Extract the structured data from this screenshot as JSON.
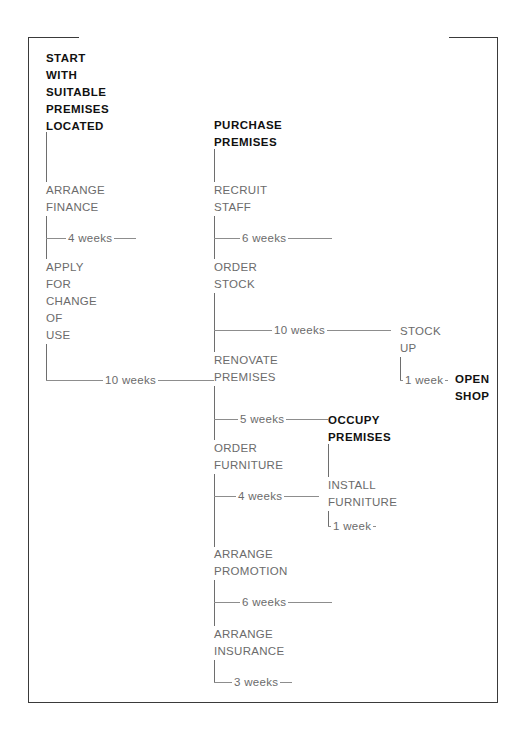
{
  "diagram": {
    "type": "critical-path-network",
    "frame_color": "#3a3a3a",
    "connector_color": "#8d8d8d",
    "milestone_color": "#111111",
    "task_color": "#6b6b6b"
  },
  "milestones": [
    {
      "id": "start",
      "label": "START\nWITH\nSUITABLE\nPREMISES\nLOCATED"
    },
    {
      "id": "purchase",
      "label": "PURCHASE\nPREMISES"
    },
    {
      "id": "occupy",
      "label": "OCCUPY\nPREMISES"
    },
    {
      "id": "open",
      "label": "OPEN\nSHOP"
    }
  ],
  "tasks": [
    {
      "id": "arrange-finance",
      "label": "ARRANGE\nFINANCE",
      "duration": "4 weeks"
    },
    {
      "id": "apply-change-use",
      "label": "APPLY\nFOR\nCHANGE\nOF\nUSE",
      "duration": "10 weeks"
    },
    {
      "id": "recruit-staff",
      "label": "RECRUIT\nSTAFF",
      "duration": "6 weeks"
    },
    {
      "id": "order-stock",
      "label": "ORDER\nSTOCK",
      "duration": "10 weeks"
    },
    {
      "id": "renovate-premises",
      "label": "RENOVATE\nPREMISES",
      "duration": "5 weeks"
    },
    {
      "id": "order-furniture",
      "label": "ORDER\nFURNITURE",
      "duration": "4 weeks"
    },
    {
      "id": "arrange-promotion",
      "label": "ARRANGE\nPROMOTION",
      "duration": "6 weeks"
    },
    {
      "id": "arrange-insurance",
      "label": "ARRANGE\nINSURANCE",
      "duration": "3 weeks"
    },
    {
      "id": "stock-up",
      "label": "STOCK\nUP",
      "duration": "1 week"
    },
    {
      "id": "install-furniture",
      "label": "INSTALL\nFURNITURE",
      "duration": "1 week"
    }
  ],
  "durations": {
    "arrange_finance": "4 weeks",
    "apply_change_use": "10 weeks",
    "recruit_staff": "6 weeks",
    "order_stock": "10 weeks",
    "renovate_premises": "5 weeks",
    "order_furniture": "4 weeks",
    "arrange_promotion": "6 weeks",
    "arrange_insurance": "3 weeks",
    "stock_up": "1 week",
    "install_furniture": "1 week"
  }
}
